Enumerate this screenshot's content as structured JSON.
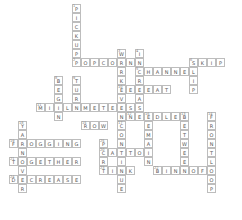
{
  "puzzle": {
    "type": "crossword",
    "cell_px": 9,
    "origin": {
      "x": 0,
      "y": 4
    },
    "words": [
      {
        "num": "1",
        "word": "PICKUP",
        "dir": "down",
        "row": 0,
        "col": 8
      },
      {
        "num": "2",
        "word": "POPCORN",
        "dir": "across",
        "row": 6,
        "col": 8
      },
      {
        "num": "3",
        "word": "WORKEVEN",
        "dir": "down",
        "row": 5,
        "col": 13
      },
      {
        "num": "4",
        "word": "INCREASE",
        "dir": "down",
        "row": 5,
        "col": 15
      },
      {
        "num": "5",
        "word": "CHANNEL",
        "dir": "across",
        "row": 7,
        "col": 15
      },
      {
        "num": "6",
        "word": "SKIP",
        "dir": "across",
        "row": 6,
        "col": 21
      },
      {
        "num": "7",
        "word": "SLIP",
        "dir": "down",
        "row": 6,
        "col": 21
      },
      {
        "num": "8",
        "word": "BEGIN",
        "dir": "down",
        "row": 8,
        "col": 6
      },
      {
        "num": "9",
        "word": "TURN",
        "dir": "down",
        "row": 8,
        "col": 8
      },
      {
        "num": "10",
        "word": "REPEAT",
        "dir": "across",
        "row": 9,
        "col": 13
      },
      {
        "num": "11",
        "word": "MILLIMETERS",
        "dir": "across",
        "row": 11,
        "col": 4
      },
      {
        "num": "12",
        "word": "NEEDLE",
        "dir": "across",
        "row": 12,
        "col": 14
      },
      {
        "num": "13",
        "word": "BETWEEN",
        "dir": "down",
        "row": 12,
        "col": 20
      },
      {
        "num": "14",
        "word": "FRONTLOOP",
        "dir": "down",
        "row": 12,
        "col": 23
      },
      {
        "num": "15",
        "word": "ROW",
        "dir": "across",
        "row": 13,
        "col": 9
      },
      {
        "num": "16",
        "word": "REMAIN",
        "dir": "down",
        "row": 12,
        "col": 16
      },
      {
        "num": "17",
        "word": "CONTINUE",
        "dir": "down",
        "row": 13,
        "col": 13
      },
      {
        "num": "18",
        "word": "YARNOVER",
        "dir": "down",
        "row": 13,
        "col": 2
      },
      {
        "num": "19",
        "word": "FROGGING",
        "dir": "across",
        "row": 15,
        "col": 1
      },
      {
        "num": "20",
        "word": "CASTON",
        "dir": "across",
        "row": 16,
        "col": 11
      },
      {
        "num": "21",
        "word": "TOGETHER",
        "dir": "across",
        "row": 17,
        "col": 1
      },
      {
        "num": "22",
        "word": "BINDOFF",
        "dir": "across",
        "row": 18,
        "col": 17
      },
      {
        "num": "23",
        "word": "TINK",
        "dir": "across",
        "row": 18,
        "col": 11
      },
      {
        "num": "24",
        "word": "DECREASE",
        "dir": "across",
        "row": 19,
        "col": 1
      },
      {
        "num": "25",
        "word": "PURL",
        "dir": "down",
        "row": 15,
        "col": 11
      }
    ]
  }
}
